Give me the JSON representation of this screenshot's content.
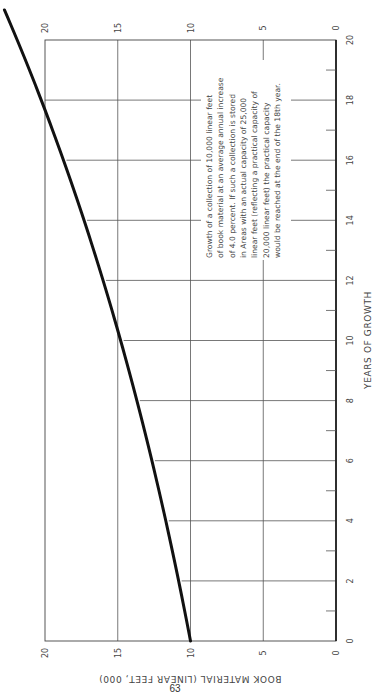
{
  "page": {
    "page_number": "63",
    "orientation": "rotated 90 degrees counter-clockwise"
  },
  "chart_data": {
    "type": "line",
    "title": "",
    "xlabel": "YEARS OF GROWTH",
    "ylabel": "BOOK MATERIAL (LINEAR FEET, 000)",
    "xlim": [
      0,
      20
    ],
    "ylim": [
      0,
      20
    ],
    "x_major_ticks": [
      0,
      2,
      4,
      6,
      8,
      10,
      12,
      14,
      16,
      18,
      20
    ],
    "x_tick_labels": [
      "0",
      "2",
      "4",
      "6",
      "8",
      "10",
      "12",
      "14",
      "16",
      "18",
      "20"
    ],
    "x_minor_ticks": [
      1,
      3,
      5,
      7,
      9,
      11,
      13,
      15,
      17,
      19
    ],
    "y_major_ticks": [
      0,
      5,
      10,
      15,
      20
    ],
    "y_tick_labels": [
      "0",
      "5",
      "10",
      "15",
      "20"
    ],
    "grid": true,
    "series": [
      {
        "name": "Collection growth at 4.0% per year",
        "initial_value": 10,
        "annual_growth_rate": 0.04,
        "x": [
          0,
          1,
          2,
          3,
          4,
          5,
          6,
          7,
          8,
          9,
          10,
          11,
          12,
          13,
          14,
          15,
          16,
          17,
          18,
          19,
          20,
          21
        ],
        "values": [
          10.0,
          10.4,
          10.82,
          11.25,
          11.7,
          12.17,
          12.65,
          13.16,
          13.69,
          14.23,
          14.8,
          15.39,
          16.01,
          16.65,
          17.32,
          18.01,
          18.73,
          19.48,
          20.26,
          21.07,
          21.91,
          22.79
        ]
      }
    ],
    "annotation": {
      "lines": [
        "Growth of a collection of 10,000 linear feet",
        "of book material at an average annual increase",
        "of 4.0 percent.  If such a collection is stored",
        "in Areas with an actual capacity of 25,000",
        "linear feet (reflecting a practical capacity of",
        "20,000 linear feet) the practical capacity",
        "would be reached at the end of the 18th year."
      ]
    }
  }
}
